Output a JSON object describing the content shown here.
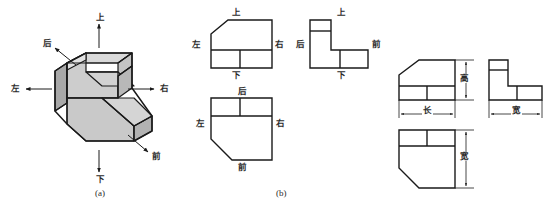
{
  "figure": {
    "captions": [
      {
        "id": "a",
        "text": "(a)",
        "x": 103,
        "y": 190
      },
      {
        "id": "b",
        "text": "(b)",
        "x": 283,
        "y": 190
      }
    ],
    "stroke_color": "#1a1a1a",
    "face_fill_light": "#d6d6d6",
    "face_fill_mid": "#bdbdbd",
    "face_fill_dark": "#a8a8a8"
  },
  "part_a": {
    "name": "isometric-pictorial-view",
    "direction_labels": [
      {
        "key": "up",
        "text": "上",
        "x": 96,
        "y": 13
      },
      {
        "key": "back",
        "text": "后",
        "x": 43,
        "y": 39
      },
      {
        "key": "left",
        "text": "左",
        "x": 11,
        "y": 86
      },
      {
        "key": "right",
        "text": "右",
        "x": 160,
        "y": 86
      },
      {
        "key": "front",
        "text": "前",
        "x": 152,
        "y": 153
      },
      {
        "key": "down",
        "text": "下",
        "x": 96,
        "y": 176
      }
    ]
  },
  "part_b": {
    "name": "three-view-projection-labeled",
    "views": [
      {
        "id": "front-view",
        "label_top": {
          "text": "上",
          "x": 232,
          "y": 9
        },
        "label_left": {
          "text": "左",
          "x": 192,
          "y": 41
        },
        "label_right": {
          "text": "右",
          "x": 274,
          "y": 41
        },
        "label_bottom": {
          "text": "下",
          "x": 232,
          "y": 75
        }
      },
      {
        "id": "side-view",
        "label_top": {
          "text": "上",
          "x": 337,
          "y": 9
        },
        "label_left": {
          "text": "后",
          "x": 296,
          "y": 41
        },
        "label_right": {
          "text": "前",
          "x": 373,
          "y": 41
        },
        "label_bottom": {
          "text": "下",
          "x": 337,
          "y": 75
        }
      },
      {
        "id": "top-view",
        "label_top": {
          "text": "后",
          "x": 238,
          "y": 88
        },
        "label_left": {
          "text": "左",
          "x": 196,
          "y": 120
        },
        "label_right": {
          "text": "右",
          "x": 275,
          "y": 120
        },
        "label_bottom": {
          "text": "前",
          "x": 238,
          "y": 168
        }
      }
    ]
  },
  "part_c": {
    "name": "three-view-projection-dimensioned",
    "dimensions": [
      {
        "key": "height",
        "text": "高",
        "x": 463,
        "y": 78,
        "orientation": "vertical"
      },
      {
        "key": "length",
        "text": "长",
        "x": 424,
        "y": 110,
        "orientation": "horizontal"
      },
      {
        "key": "width_h",
        "text": "宽",
        "x": 513,
        "y": 110,
        "orientation": "horizontal"
      },
      {
        "key": "width_v",
        "text": "宽",
        "x": 463,
        "y": 158,
        "orientation": "vertical"
      }
    ]
  }
}
